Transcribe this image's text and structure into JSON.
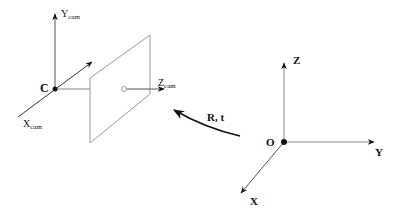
{
  "camera_frame": {
    "center_label": "C",
    "x_axis": {
      "label": "X",
      "subscript": "cam"
    },
    "y_axis": {
      "label": "Y",
      "subscript": "cam"
    },
    "z_axis": {
      "label": "Z",
      "subscript": "cam"
    }
  },
  "image_plane": {
    "principal_point": "o"
  },
  "transform": {
    "label": "R, t"
  },
  "world_frame": {
    "origin_label": "O",
    "x_axis": {
      "label": "X"
    },
    "y_axis": {
      "label": "Y"
    },
    "z_axis": {
      "label": "Z"
    }
  },
  "colors": {
    "axis_dark": "#111111",
    "axis_gray": "#888888",
    "plane": "#999999"
  }
}
